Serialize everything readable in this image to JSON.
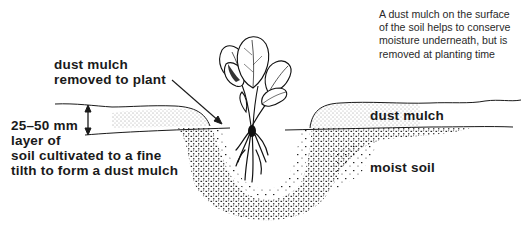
{
  "caption": {
    "lines": [
      "A dust mulch on the surface",
      "of the soil helps to conserve",
      "moisture underneath, but is",
      "removed at planting time"
    ]
  },
  "labels": {
    "removed": [
      "dust mulch",
      "removed to plant"
    ],
    "layer": [
      "25–50 mm",
      "layer of",
      "soil cultivated to a fine",
      "tilth to form a dust mulch"
    ],
    "dust_mulch": "dust mulch",
    "moist_soil": "moist soil"
  },
  "diagram": {
    "line_color": "#1a1a1a",
    "stipple_color": "#222222",
    "background": "#ffffff"
  }
}
